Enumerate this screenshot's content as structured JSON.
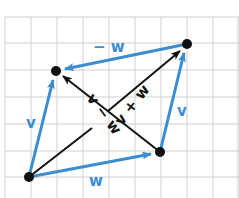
{
  "diagram": {
    "colors": {
      "blue": "#3b8dd2",
      "black": "#111111",
      "grid": "#cfcfcf",
      "background": "#ffffff"
    },
    "grid": {
      "x0": 5,
      "y0": 17,
      "dx": 26,
      "dy": 26.7,
      "cols": 9,
      "rows": 7
    },
    "points": {
      "origin": {
        "x": 29,
        "y": 177
      },
      "top_left": {
        "x": 56,
        "y": 71
      },
      "top_right": {
        "x": 187,
        "y": 44
      },
      "bottom_right": {
        "x": 160,
        "y": 152
      }
    },
    "labels": {
      "v_left": "v",
      "v_right": "v",
      "w_bottom": "w",
      "neg_w_top": "− w",
      "v_plus_w": "v + w",
      "v_minus_w": "v − w"
    }
  }
}
